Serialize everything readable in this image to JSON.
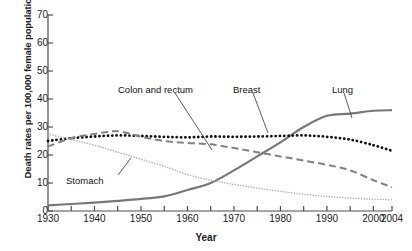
{
  "chart_data": {
    "type": "line",
    "title": "",
    "xlabel": "Year",
    "ylabel": "Death rates per 100,000 female population",
    "xlim": [
      1930,
      2004
    ],
    "ylim": [
      0,
      70
    ],
    "ytick_values": [
      0,
      10,
      20,
      30,
      40,
      50,
      60,
      70
    ],
    "ytick_labels": [
      "0",
      "10",
      "20",
      "30",
      "40",
      "50",
      "60",
      "70"
    ],
    "xtick_values": [
      1930,
      1935,
      1940,
      1945,
      1950,
      1955,
      1960,
      1965,
      1970,
      1975,
      1980,
      1985,
      1990,
      1995,
      2000,
      2004
    ],
    "xtick_labels": [
      "1930",
      "1940",
      "1950",
      "1960",
      "1970",
      "1980",
      "1990",
      "2000",
      "2004"
    ],
    "xtick_label_values": [
      1930,
      1940,
      1950,
      1960,
      1970,
      1980,
      1990,
      2000,
      2004
    ],
    "grid": false,
    "legend": "inline-annotations",
    "x": [
      1930,
      1935,
      1940,
      1945,
      1950,
      1955,
      1960,
      1965,
      1970,
      1975,
      1980,
      1985,
      1990,
      1995,
      2000,
      2004
    ],
    "series": [
      {
        "name": "Lung",
        "style": "solid",
        "color": "#777777",
        "values": [
          2,
          2.5,
          3,
          3.6,
          4.3,
          5.2,
          7.5,
          10,
          14.5,
          19.5,
          24.5,
          30,
          34,
          34.8,
          35.8,
          36
        ]
      },
      {
        "name": "Breast",
        "style": "dotted",
        "color": "#111111",
        "values": [
          25,
          26,
          26.6,
          27,
          26.8,
          26.5,
          26.3,
          26.6,
          26.5,
          26.6,
          26.8,
          27,
          26.5,
          25.5,
          23.5,
          21.5
        ]
      },
      {
        "name": "Colon and rectum",
        "style": "dashed",
        "color": "#808080",
        "values": [
          23,
          26,
          27.5,
          28.5,
          26.5,
          25,
          24.3,
          23.8,
          22.5,
          21,
          19.5,
          18,
          16.5,
          14.5,
          11,
          8.5
        ]
      },
      {
        "name": "Stomach",
        "style": "fine-dotted",
        "color": "#b5b5b5",
        "values": [
          27.5,
          25.5,
          23.5,
          21,
          18.5,
          16,
          13,
          11,
          9.5,
          8.2,
          7,
          6,
          5.2,
          4.6,
          4.2,
          4
        ]
      }
    ],
    "annotations": [
      {
        "text": "Colon and rectum",
        "label_x": 118,
        "label_y": 85,
        "leader_x1": 175,
        "leader_y1": 93,
        "leader_x2": 212,
        "leader_y2": 150
      },
      {
        "text": "Breast",
        "label_x": 233,
        "label_y": 85,
        "leader_x1": 253,
        "leader_y1": 93,
        "leader_x2": 268,
        "leader_y2": 133
      },
      {
        "text": "Lung",
        "label_x": 332,
        "label_y": 85,
        "leader_x1": 344,
        "leader_y1": 93,
        "leader_x2": 352,
        "leader_y2": 118
      },
      {
        "text": "Stomach",
        "label_x": 66,
        "label_y": 176,
        "leader_x1": 118,
        "leader_y1": 175,
        "leader_x2": 131,
        "leader_y2": 158
      }
    ]
  }
}
